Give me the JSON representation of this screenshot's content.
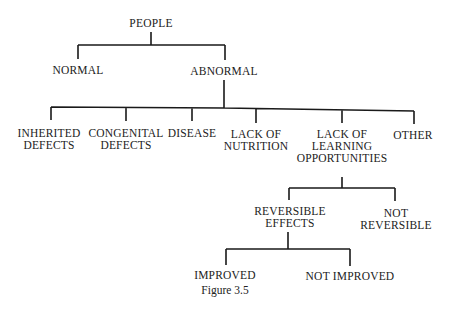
{
  "figure": {
    "caption": "Figure 3.5",
    "nodes": {
      "people": "PEOPLE",
      "normal": "NORMAL",
      "abnormal": "ABNORMAL",
      "inherited_l1": "INHERITED",
      "inherited_l2": "DEFECTS",
      "congenital_l1": "CONGENITAL",
      "congenital_l2": "DEFECTS",
      "disease": "DISEASE",
      "nutrition_l1": "LACK OF",
      "nutrition_l2": "NUTRITION",
      "learning_l1": "LACK OF",
      "learning_l2": "LEARNING",
      "learning_l3": "OPPORTUNITIES",
      "other": "OTHER",
      "reversible_l1": "REVERSIBLE",
      "reversible_l2": "EFFECTS",
      "notrev_l1": "NOT",
      "notrev_l2": "REVERSIBLE",
      "improved": "IMPROVED",
      "not_improved": "NOT IMPROVED"
    },
    "line_color": "#1a1a1a"
  }
}
